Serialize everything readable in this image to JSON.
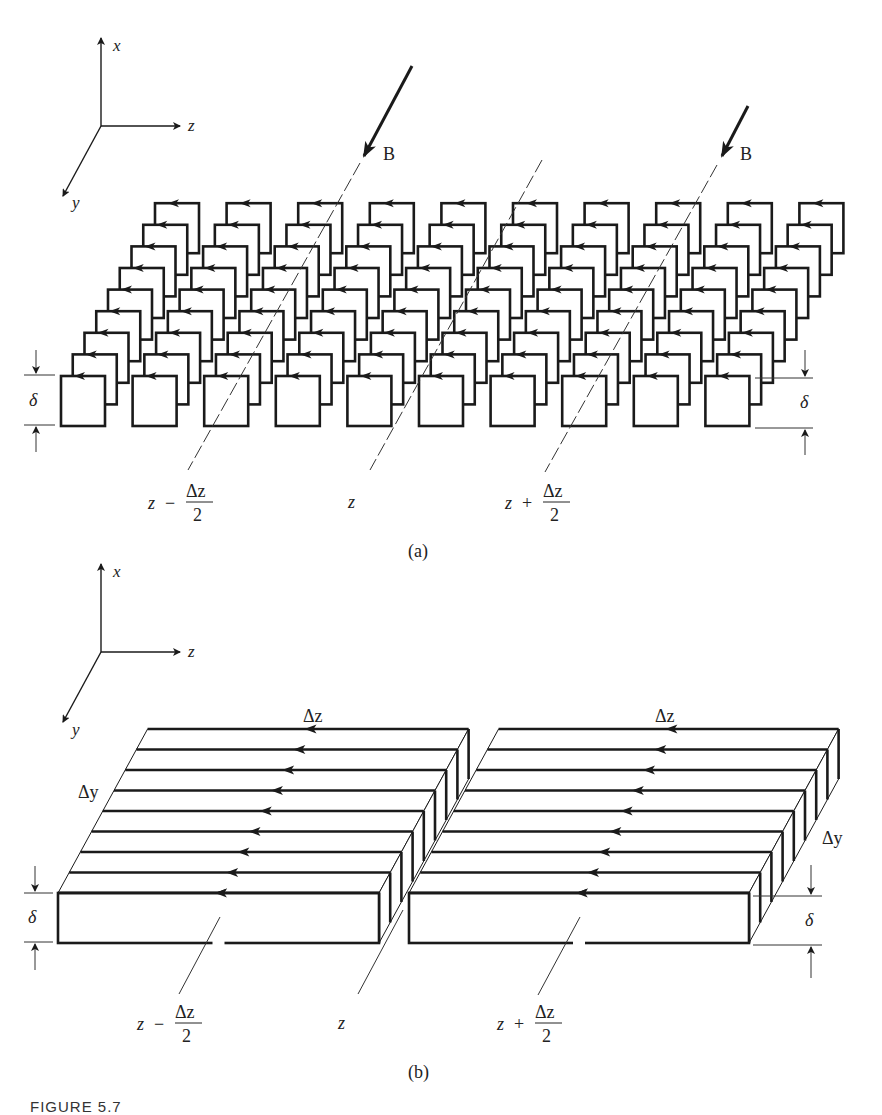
{
  "figure": {
    "caption": "FIGURE 5.7",
    "stroke_color": "#1a1a1a",
    "background": "#ffffff"
  },
  "part_a": {
    "label": "(a)",
    "axes": {
      "x": "x",
      "y": "y",
      "z": "z"
    },
    "field_label": "B",
    "thickness_label": "δ",
    "columns": 10,
    "rows": 9,
    "guide_labels": [
      {
        "text": "z",
        "op": "−",
        "num": "Δz",
        "den": "2"
      },
      {
        "text": "z"
      },
      {
        "text": "z",
        "op": "+",
        "num": "Δz",
        "den": "2"
      }
    ],
    "description": "Array of square current loops in the x-z plane, stacked along y, each carrying circulating current (arrows), magnetic field B incident"
  },
  "part_b": {
    "label": "(b)",
    "axes": {
      "x": "x",
      "y": "y",
      "z": "z"
    },
    "length_label": "Δz",
    "width_label": "Δy",
    "thickness_label": "δ",
    "slabs": 2,
    "strips_per_slab": 9,
    "guide_labels": [
      {
        "text": "z",
        "op": "−",
        "num": "Δz",
        "den": "2"
      },
      {
        "text": "z"
      },
      {
        "text": "z",
        "op": "+",
        "num": "Δz",
        "den": "2"
      }
    ],
    "description": "Equivalent slabs of thickness δ with surface currents along −z on each strip of width Δy"
  }
}
